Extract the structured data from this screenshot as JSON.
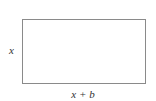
{
  "diagram": {
    "shape": "rectangle",
    "side_label": "x",
    "bottom_label": "x + b",
    "stroke_color": "#8a8a8a"
  }
}
